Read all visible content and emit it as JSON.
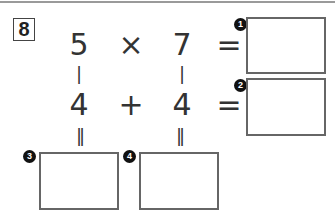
{
  "problem": {
    "number": "8",
    "row1": {
      "a": "5",
      "op": "×",
      "b": "7",
      "eq": "="
    },
    "connectors_minus": {
      "left": "|",
      "right": "|"
    },
    "row2": {
      "a": "4",
      "op": "+",
      "b": "4",
      "eq": "="
    },
    "connectors_equal": {
      "left": "||",
      "right": "||"
    },
    "answer_boxes": [
      {
        "label": "1",
        "value": ""
      },
      {
        "label": "2",
        "value": ""
      },
      {
        "label": "3",
        "value": ""
      },
      {
        "label": "4",
        "value": ""
      }
    ]
  }
}
